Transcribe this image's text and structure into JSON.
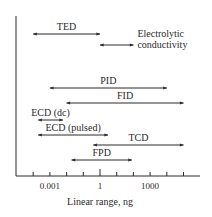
{
  "chart_data": {
    "type": "range-bar",
    "title": "",
    "xlabel": "Linear range, ng",
    "ylabel": "",
    "x_scale": "log10",
    "xlim_log10": [
      -5,
      5.5
    ],
    "tick_log10": [
      -4,
      -3,
      -2,
      -1,
      0,
      1,
      2,
      3,
      4,
      5
    ],
    "tick_labels": [
      {
        "log10": -3,
        "label": "0.001"
      },
      {
        "log10": 0,
        "label": "1"
      },
      {
        "log10": 3,
        "label": "1000"
      }
    ],
    "grid": false,
    "legend": "none",
    "series": [
      {
        "name": "TED",
        "min_ng": 0.0001,
        "max_ng": 1,
        "label_lines": [
          "TED"
        ],
        "label_pos": "above"
      },
      {
        "name": "Electrolytic conductivity",
        "min_ng": 1,
        "max_ng": 100,
        "label_lines": [
          "Electrolytic",
          "conductivity"
        ],
        "label_pos": "right"
      },
      {
        "name": "PID",
        "min_ng": 0.001,
        "max_ng": 10000,
        "label_lines": [
          "PID"
        ],
        "label_pos": "above"
      },
      {
        "name": "FID",
        "min_ng": 0.01,
        "max_ng": 100000,
        "label_lines": [
          "FID"
        ],
        "label_pos": "above"
      },
      {
        "name": "ECD (dc)",
        "min_ng": 0.0002,
        "max_ng": 0.006,
        "label_lines": [
          "ECD (dc)"
        ],
        "label_pos": "above"
      },
      {
        "name": "ECD (pulsed)",
        "min_ng": 0.0002,
        "max_ng": 3,
        "label_lines": [
          "ECD (pulsed)"
        ],
        "label_pos": "above"
      },
      {
        "name": "TCD",
        "min_ng": 0.4,
        "max_ng": 100000,
        "label_lines": [
          "TCD"
        ],
        "label_pos": "above"
      },
      {
        "name": "FPD",
        "min_ng": 0.02,
        "max_ng": 80,
        "label_lines": [
          "FPD"
        ],
        "label_pos": "above"
      }
    ]
  },
  "colors": {
    "ink": "#2a2a2a",
    "background": "#ffffff"
  }
}
